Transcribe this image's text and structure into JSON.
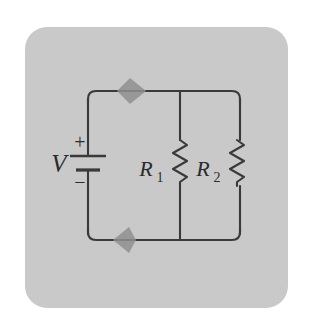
{
  "figure": {
    "kind": "circuit-schematic",
    "page_background": "#ffffff",
    "panel_background": "#c9c9c9",
    "line_color": "#3a3a3a",
    "arrow_color": "#8a8a8a",
    "panel": {
      "x": 25,
      "y": 27,
      "width": 263,
      "height": 281,
      "corner_radius": 22
    }
  },
  "circuit": {
    "loop": {
      "left": 88,
      "right": 240,
      "top": 91,
      "bottom": 240,
      "corner_radius": 12
    },
    "source": {
      "label": "V",
      "plus_sign": "+",
      "minus_sign": "−",
      "type": "battery",
      "x": 88,
      "plate_long_y": 156,
      "plate_short_y": 170
    },
    "branches": [
      {
        "label": "R",
        "subscript": "1",
        "full_label": "R1",
        "type": "resistor",
        "x": 180,
        "zigzag_top": 140,
        "zigzag_bottom": 186,
        "label_x": 152,
        "label_y": 170
      },
      {
        "label": "R",
        "subscript": "2",
        "full_label": "R2",
        "type": "resistor",
        "x": 237,
        "zigzag_top": 140,
        "zigzag_bottom": 186,
        "label_x": 209,
        "label_y": 170
      }
    ],
    "current_arrows": [
      {
        "name": "top-current-arrow",
        "direction": "right",
        "x": 130,
        "y": 91
      },
      {
        "name": "bottom-current-arrow",
        "direction": "left",
        "x": 125,
        "y": 240
      }
    ]
  }
}
